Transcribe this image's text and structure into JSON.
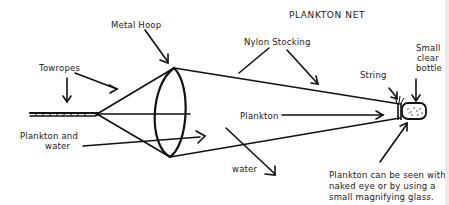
{
  "diagram": {
    "title": "PLANKTON NET",
    "labels": {
      "metal_hoop": "Metal Hoop",
      "towropes": "Towropes",
      "nylon_stocking": "Nylon Stocking",
      "string": "String",
      "bottle_line1": "Small",
      "bottle_line2": "clear",
      "bottle_line3": "bottle",
      "plankton_water_line1": "Plankton and",
      "plankton_water_line2": "water",
      "plankton": "Plankton",
      "water": "water",
      "note_line1": "Plankton can be seen with",
      "note_line2": "naked eye or by using a",
      "note_line3": "small magnifying glass."
    },
    "colors": {
      "ink": "#111111",
      "background": "#ffffff"
    }
  }
}
